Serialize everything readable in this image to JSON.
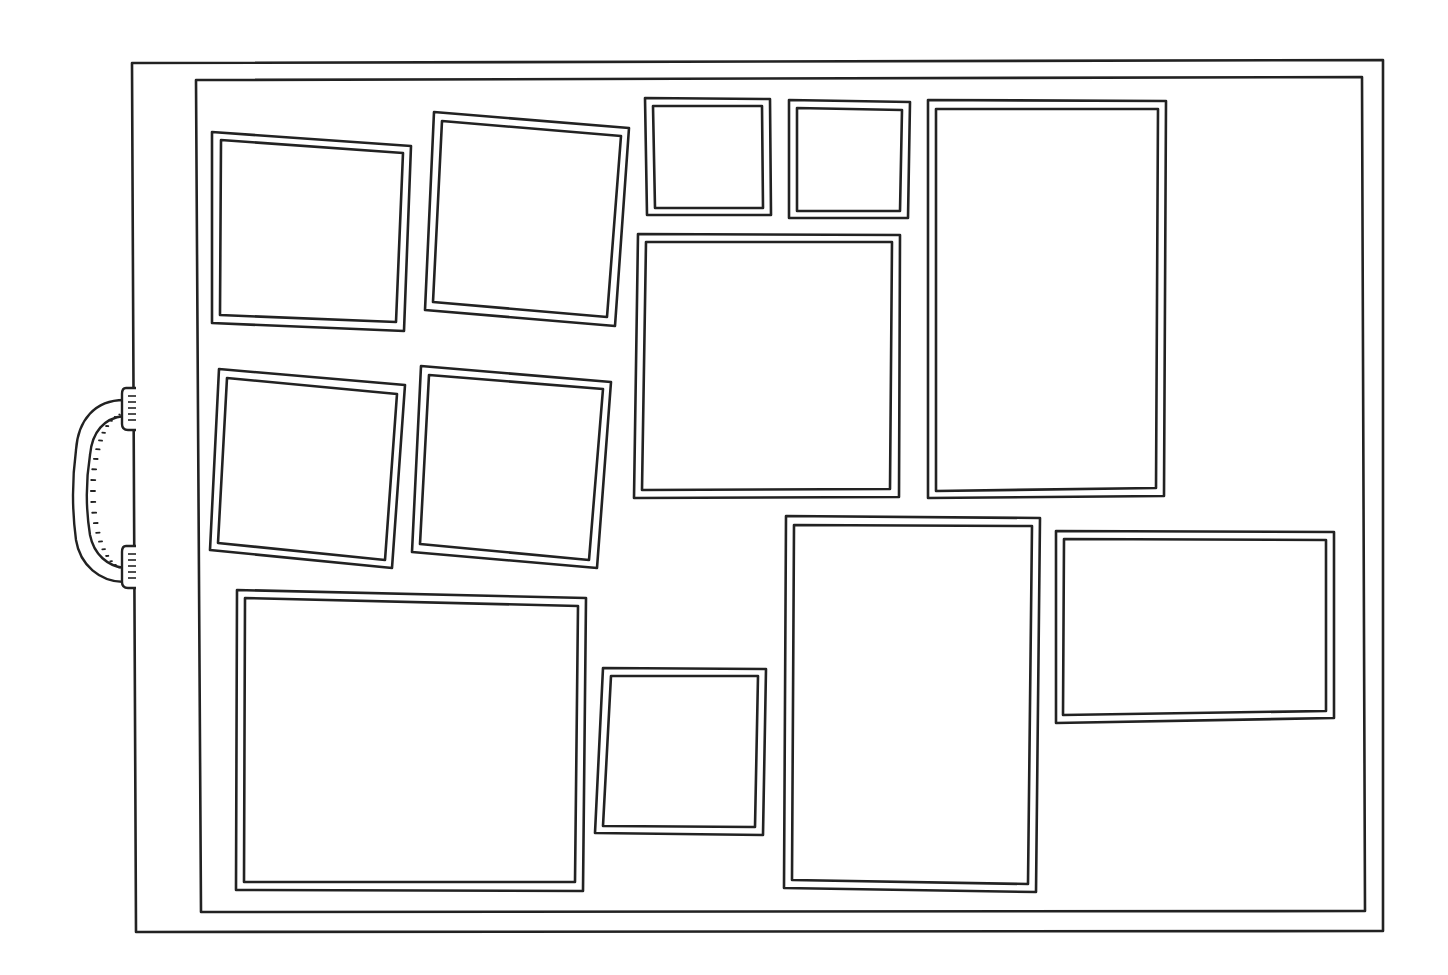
{
  "illustration": {
    "subject": "portfolio case with picture frames",
    "colors": {
      "stroke": "#222222",
      "background": "#ffffff"
    },
    "case": {
      "outer": [
        [
          132,
          63
        ],
        [
          1383,
          60
        ],
        [
          1383,
          931
        ],
        [
          136,
          932
        ]
      ],
      "inner": [
        [
          196,
          80
        ],
        [
          1362,
          77
        ],
        [
          1365,
          911
        ],
        [
          201,
          912
        ]
      ]
    },
    "handle": {
      "side": "left",
      "top_y": 395,
      "bottom_y": 585
    },
    "frames": [
      {
        "id": "frame-1",
        "outer": [
          [
            212,
            132
          ],
          [
            411,
            146
          ],
          [
            404,
            331
          ],
          [
            212,
            323
          ]
        ],
        "inner": [
          [
            221,
            140
          ],
          [
            403,
            153
          ],
          [
            396,
            322
          ],
          [
            220,
            315
          ]
        ]
      },
      {
        "id": "frame-2",
        "outer": [
          [
            434,
            112
          ],
          [
            629,
            128
          ],
          [
            615,
            326
          ],
          [
            425,
            310
          ]
        ],
        "inner": [
          [
            442,
            121
          ],
          [
            621,
            136
          ],
          [
            607,
            317
          ],
          [
            433,
            302
          ]
        ]
      },
      {
        "id": "frame-3",
        "outer": [
          [
            645,
            98
          ],
          [
            770,
            99
          ],
          [
            771,
            215
          ],
          [
            647,
            215
          ]
        ],
        "inner": [
          [
            653,
            106
          ],
          [
            762,
            106
          ],
          [
            763,
            208
          ],
          [
            655,
            208
          ]
        ]
      },
      {
        "id": "frame-4",
        "outer": [
          [
            789,
            100
          ],
          [
            910,
            102
          ],
          [
            908,
            218
          ],
          [
            789,
            218
          ]
        ],
        "inner": [
          [
            797,
            108
          ],
          [
            902,
            110
          ],
          [
            900,
            211
          ],
          [
            797,
            211
          ]
        ]
      },
      {
        "id": "frame-5",
        "outer": [
          [
            928,
            100
          ],
          [
            1166,
            101
          ],
          [
            1164,
            496
          ],
          [
            928,
            498
          ]
        ],
        "inner": [
          [
            936,
            109
          ],
          [
            1158,
            109
          ],
          [
            1156,
            488
          ],
          [
            936,
            491
          ]
        ]
      },
      {
        "id": "frame-6",
        "outer": [
          [
            638,
            234
          ],
          [
            900,
            235
          ],
          [
            899,
            497
          ],
          [
            634,
            498
          ]
        ],
        "inner": [
          [
            646,
            242
          ],
          [
            892,
            242
          ],
          [
            890,
            489
          ],
          [
            642,
            490
          ]
        ]
      },
      {
        "id": "frame-7",
        "outer": [
          [
            219,
            369
          ],
          [
            405,
            385
          ],
          [
            392,
            568
          ],
          [
            210,
            550
          ]
        ],
        "inner": [
          [
            227,
            378
          ],
          [
            397,
            394
          ],
          [
            385,
            560
          ],
          [
            218,
            543
          ]
        ]
      },
      {
        "id": "frame-8",
        "outer": [
          [
            421,
            366
          ],
          [
            611,
            382
          ],
          [
            597,
            568
          ],
          [
            412,
            552
          ]
        ],
        "inner": [
          [
            429,
            375
          ],
          [
            603,
            389
          ],
          [
            589,
            560
          ],
          [
            420,
            544
          ]
        ]
      },
      {
        "id": "frame-9",
        "outer": [
          [
            786,
            516
          ],
          [
            1040,
            518
          ],
          [
            1036,
            892
          ],
          [
            784,
            888
          ]
        ],
        "inner": [
          [
            794,
            525
          ],
          [
            1032,
            526
          ],
          [
            1028,
            884
          ],
          [
            792,
            880
          ]
        ]
      },
      {
        "id": "frame-10",
        "outer": [
          [
            1056,
            531
          ],
          [
            1334,
            532
          ],
          [
            1334,
            718
          ],
          [
            1056,
            723
          ]
        ],
        "inner": [
          [
            1064,
            539
          ],
          [
            1326,
            540
          ],
          [
            1326,
            711
          ],
          [
            1063,
            715
          ]
        ]
      },
      {
        "id": "frame-11",
        "outer": [
          [
            237,
            590
          ],
          [
            586,
            598
          ],
          [
            583,
            891
          ],
          [
            236,
            890
          ]
        ],
        "inner": [
          [
            245,
            598
          ],
          [
            578,
            606
          ],
          [
            575,
            882
          ],
          [
            244,
            882
          ]
        ]
      },
      {
        "id": "frame-12",
        "outer": [
          [
            603,
            668
          ],
          [
            766,
            669
          ],
          [
            763,
            835
          ],
          [
            595,
            833
          ]
        ],
        "inner": [
          [
            611,
            676
          ],
          [
            758,
            676
          ],
          [
            755,
            827
          ],
          [
            603,
            826
          ]
        ]
      }
    ]
  }
}
